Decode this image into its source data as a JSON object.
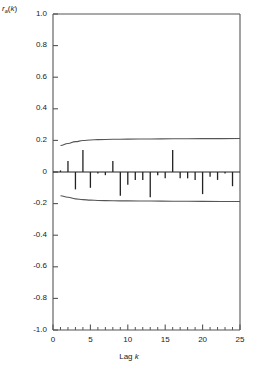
{
  "chart_data": {
    "type": "bar",
    "title": "",
    "subtitle": "",
    "ylabel": "r_a(k)",
    "ylabel_base": "r",
    "ylabel_sub": "a",
    "ylabel_arg": "(k)",
    "xlabel": "Lag k",
    "xlabel_text": "Lag ",
    "xlabel_var": "k",
    "x": [
      1,
      2,
      3,
      4,
      5,
      6,
      7,
      8,
      9,
      10,
      11,
      12,
      13,
      14,
      15,
      16,
      17,
      18,
      19,
      20,
      21,
      22,
      23,
      24
    ],
    "values": [
      0.01,
      0.07,
      -0.11,
      0.14,
      -0.1,
      -0.01,
      -0.02,
      0.07,
      -0.15,
      -0.08,
      -0.05,
      -0.05,
      -0.16,
      -0.02,
      -0.04,
      0.14,
      -0.04,
      -0.04,
      -0.05,
      -0.14,
      -0.03,
      -0.05,
      -0.01,
      -0.09
    ],
    "xlim": [
      0,
      25
    ],
    "ylim": [
      -1.0,
      1.0
    ],
    "yticks": [
      1.0,
      0.8,
      0.6,
      0.4,
      0.2,
      0,
      -0.2,
      -0.4,
      -0.6,
      -0.8,
      -1.0
    ],
    "ytick_labels": [
      "1.0",
      "0.8",
      "0.6",
      "0.4",
      "0.2",
      "0",
      "-0.2",
      "-0.4",
      "-0.6",
      "-0.8",
      "-1.0"
    ],
    "xticks": [
      0,
      5,
      10,
      15,
      20,
      25
    ],
    "xtick_labels": [
      "0",
      "5",
      "10",
      "15",
      "20",
      "25"
    ],
    "xminor_ticks": [
      1,
      2,
      3,
      4,
      6,
      7,
      8,
      9,
      11,
      12,
      13,
      14,
      16,
      17,
      18,
      19,
      21,
      22,
      23,
      24
    ],
    "grid": false,
    "legend": null,
    "series": [
      {
        "name": "residual autocorrelation",
        "kind": "stem",
        "values": [
          0.01,
          0.07,
          -0.11,
          0.14,
          -0.1,
          -0.01,
          -0.02,
          0.07,
          -0.15,
          -0.08,
          -0.05,
          -0.05,
          -0.16,
          -0.02,
          -0.04,
          0.14,
          -0.04,
          -0.04,
          -0.05,
          -0.14,
          -0.03,
          -0.05,
          -0.01,
          -0.09
        ]
      },
      {
        "name": "upper confidence limit",
        "kind": "line",
        "x": [
          1,
          2,
          3,
          4,
          5,
          6,
          8,
          10,
          13,
          16,
          20,
          25
        ],
        "values": [
          0.168,
          0.18,
          0.192,
          0.199,
          0.203,
          0.205,
          0.207,
          0.208,
          0.209,
          0.21,
          0.211,
          0.212
        ]
      },
      {
        "name": "lower confidence limit",
        "kind": "line",
        "x": [
          1,
          2,
          3,
          4,
          5,
          6,
          8,
          10,
          13,
          16,
          20,
          25
        ],
        "values": [
          -0.15,
          -0.16,
          -0.17,
          -0.175,
          -0.178,
          -0.18,
          -0.182,
          -0.183,
          -0.184,
          -0.185,
          -0.186,
          -0.187
        ]
      }
    ],
    "annotations": [],
    "line_color": "#555555",
    "stem_color": "#222222",
    "axis_color": "#555555"
  },
  "axis": {
    "y_title_parts": {
      "base": "r",
      "sub": "a",
      "arg": "(k)"
    },
    "x_title_parts": {
      "text": "Lag ",
      "var": "k"
    }
  }
}
